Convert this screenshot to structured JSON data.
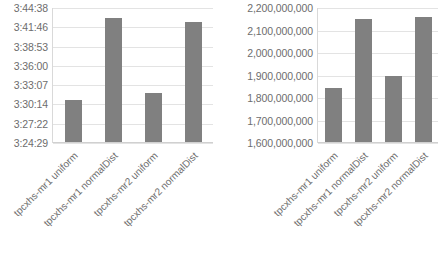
{
  "chart_data": [
    {
      "type": "bar",
      "title": "",
      "xlabel": "",
      "ylabel": "",
      "grid": true,
      "legend": false,
      "bar_color": "#808080",
      "categories": [
        "tpcxhs-mr1 uniform",
        "tpcxhs-mr1 normalDist",
        "tpcxhs-mr2 uniform",
        "tpcxhs-mr2 normalDist"
      ],
      "ytick_labels": [
        "3:44:38",
        "3:41:46",
        "3:38:53",
        "3:36:00",
        "3:33:07",
        "3:30:14",
        "3:27:22",
        "3:24:29"
      ],
      "ytick_values": [
        13478,
        13306,
        13133,
        12960,
        12787,
        12614,
        12442,
        12269
      ],
      "ylim": [
        12269,
        13478
      ],
      "values": [
        12650,
        13390,
        12710,
        13355
      ],
      "value_labels": [
        "3:30:50",
        "3:43:10",
        "3:31:50",
        "3:42:35"
      ]
    },
    {
      "type": "bar",
      "title": "",
      "xlabel": "",
      "ylabel": "",
      "grid": true,
      "legend": false,
      "bar_color": "#808080",
      "categories": [
        "tpcxhs-mr1 uniform",
        "tpcxhs-mr1 normalDist",
        "tpcxhs-mr2 uniform",
        "tpcxhs-mr2 normalDist"
      ],
      "ytick_labels": [
        "2,200,000,000",
        "2,100,000,000",
        "2,000,000,000",
        "1,900,000,000",
        "1,800,000,000",
        "1,700,000,000",
        "1,600,000,000"
      ],
      "ytick_values": [
        2200000000,
        2100000000,
        2000000000,
        1900000000,
        1800000000,
        1700000000,
        1600000000
      ],
      "ylim": [
        1600000000,
        2200000000
      ],
      "values": [
        1840000000,
        2150000000,
        1895000000,
        2160000000
      ],
      "value_labels": [
        "1,840,000,000",
        "2,150,000,000",
        "1,895,000,000",
        "2,160,000,000"
      ]
    }
  ]
}
